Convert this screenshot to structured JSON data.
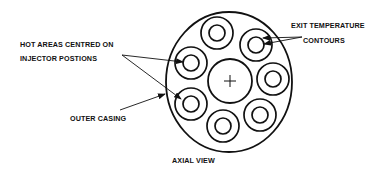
{
  "diagram": {
    "title": "AXIAL VIEW",
    "labels": {
      "hot_areas_line1": "HOT AREAS CENTRED ON",
      "hot_areas_line2": "INJECTOR POSTIONS",
      "outer_casing": "OUTER CASING",
      "exit_temp_line1": "EXIT TEMPERATURE",
      "exit_temp_line2": "CONTOURS",
      "axial_view": "AXIAL VIEW"
    },
    "center_symbol": "+",
    "colors": {
      "stroke": "#111111",
      "background": "#ffffff"
    },
    "injector_count": 7
  }
}
